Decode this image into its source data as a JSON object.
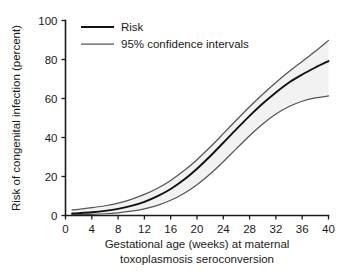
{
  "chart_data": {
    "type": "line",
    "title": "",
    "subtitle": "",
    "xlabel_line1": "Gestational age (weeks) at maternal",
    "xlabel_line2": "toxoplasmosis seroconversion",
    "ylabel": "Risk of congenital infection (percent)",
    "xlim": [
      0,
      40
    ],
    "ylim": [
      0,
      100
    ],
    "xticks": [
      0,
      4,
      8,
      12,
      16,
      20,
      24,
      28,
      32,
      36,
      40
    ],
    "xtick_labels": [
      "0",
      "4",
      "8",
      "12",
      "16",
      "20",
      "24",
      "28",
      "32",
      "36",
      "40"
    ],
    "yticks": [
      0,
      20,
      40,
      60,
      80,
      100
    ],
    "ytick_labels": [
      "0",
      "20",
      "40",
      "60",
      "80",
      "100"
    ],
    "grid": false,
    "legend_position": "top-left-inside",
    "x": [
      1,
      2,
      4,
      6,
      8,
      10,
      12,
      14,
      16,
      18,
      20,
      22,
      24,
      26,
      28,
      30,
      32,
      34,
      36,
      38,
      40
    ],
    "series": [
      {
        "name": "Risk",
        "role": "central-estimate",
        "color": "#111111",
        "values": [
          1.0,
          1.2,
          1.7,
          2.4,
          3.4,
          4.9,
          7.0,
          9.9,
          13.6,
          18.3,
          24.0,
          30.4,
          37.3,
          44.3,
          51.1,
          57.4,
          63.1,
          68.2,
          72.3,
          75.9,
          79.2
        ]
      },
      {
        "name": "95% confidence intervals (upper)",
        "role": "upper-bound",
        "color": "#555555",
        "values": [
          2.9,
          3.2,
          4.0,
          5.0,
          6.4,
          8.3,
          10.8,
          14.0,
          18.0,
          22.9,
          28.6,
          35.1,
          42.0,
          49.0,
          55.8,
          62.2,
          68.2,
          73.8,
          79.0,
          84.2,
          89.8
        ]
      },
      {
        "name": "95% confidence intervals (lower)",
        "role": "lower-bound",
        "color": "#555555",
        "values": [
          0.3,
          0.4,
          0.6,
          0.9,
          1.4,
          2.2,
          3.4,
          5.2,
          7.8,
          11.3,
          15.8,
          21.3,
          27.6,
          34.3,
          40.9,
          46.9,
          52.0,
          55.9,
          58.6,
          60.3,
          61.3
        ]
      }
    ],
    "band_fill": "#f2f2f2"
  },
  "legend": {
    "items": [
      {
        "label": "Risk",
        "color": "#111111",
        "width": 1.9
      },
      {
        "label": "95% confidence intervals",
        "color": "#555555",
        "width": 1.25
      }
    ]
  },
  "axes": {
    "y_title": "Risk of congenital infection (percent)",
    "x_title_line1": "Gestational age (weeks) at maternal",
    "x_title_line2": "toxoplasmosis seroconversion"
  }
}
